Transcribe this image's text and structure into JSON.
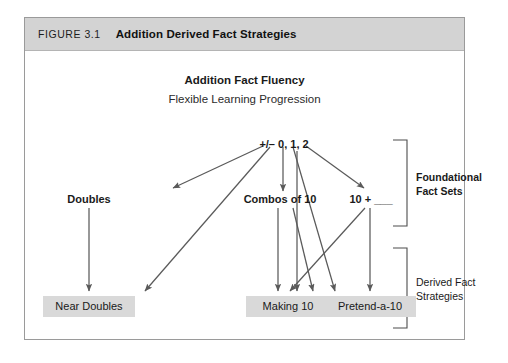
{
  "figure": {
    "number_label": "FIGURE 3.1",
    "title": "Addition Derived Fact Strategies"
  },
  "diagram": {
    "title": "Addition Fact Fluency",
    "subtitle": "Flexible Learning Progression",
    "root_node": "+/– 0, 1, 2",
    "middle_nodes": [
      {
        "label": "Doubles"
      },
      {
        "label": "Combos of 10"
      },
      {
        "label": "10 + ___"
      }
    ],
    "bottom_boxes": [
      {
        "label": "Near Doubles"
      },
      {
        "label": "Making 10"
      },
      {
        "label": "Pretend-a-10"
      }
    ],
    "brackets": [
      {
        "label": "Foundational Fact Sets"
      },
      {
        "label": "Derived Fact Strategies"
      }
    ]
  },
  "colors": {
    "header_bar": "#d3d3d3",
    "box_fill": "#d9d9d9",
    "frame_border": "#9a9a9a",
    "arrow": "#5a5a5a",
    "text": "#1a1a1a"
  }
}
